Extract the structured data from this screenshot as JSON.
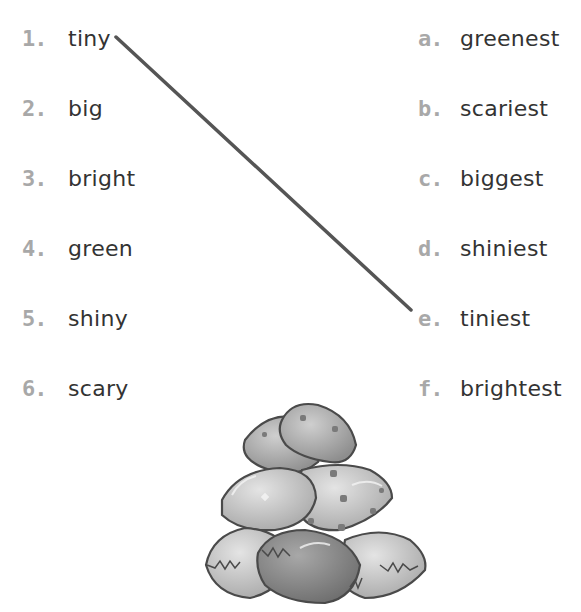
{
  "exercise": {
    "left_items": [
      {
        "marker": "1.",
        "word": "tiny"
      },
      {
        "marker": "2.",
        "word": "big"
      },
      {
        "marker": "3.",
        "word": "bright"
      },
      {
        "marker": "4.",
        "word": "green"
      },
      {
        "marker": "5.",
        "word": "shiny"
      },
      {
        "marker": "6.",
        "word": "scary"
      }
    ],
    "right_items": [
      {
        "marker": "a.",
        "word": "greenest"
      },
      {
        "marker": "b.",
        "word": "scariest"
      },
      {
        "marker": "c.",
        "word": "biggest"
      },
      {
        "marker": "d.",
        "word": "shiniest"
      },
      {
        "marker": "e.",
        "word": "tiniest"
      },
      {
        "marker": "f.",
        "word": "brightest"
      }
    ],
    "example_match": {
      "from": "1. tiny",
      "to": "e. tiniest"
    },
    "illustration": "pile-of-eggs",
    "colors": {
      "text": "#333333",
      "marker": "#a8a8a8",
      "line": "#555555"
    }
  }
}
